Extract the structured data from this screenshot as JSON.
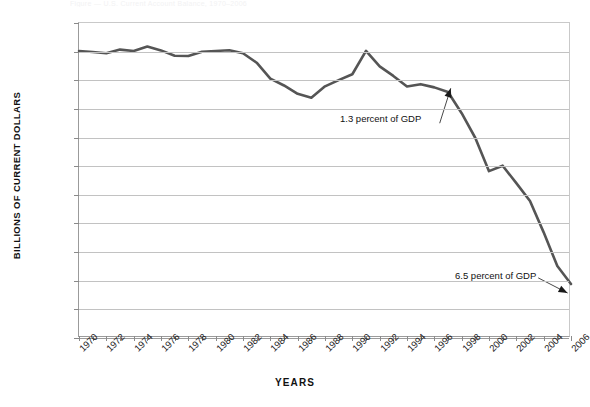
{
  "figure": {
    "title_remnant": "Figure — U.S. Current Account Balance, 1970–2006"
  },
  "axes": {
    "ylabel": "BILLIONS OF CURRENT DOLLARS",
    "xlabel": "YEARS"
  },
  "chart_data": {
    "type": "line",
    "title": "",
    "xlabel": "YEARS",
    "ylabel": "BILLIONS OF CURRENT DOLLARS",
    "ylim": [
      -1000000,
      100000
    ],
    "xlim": [
      1970,
      2006
    ],
    "grid": true,
    "legend": "none",
    "ytick_labels": [
      "100,000",
      "0",
      "–100,000",
      "–200,000",
      "–300,000",
      "–400,000",
      "–500,000",
      "–600,000",
      "–700,000",
      "–800,000",
      "–900,000",
      "–1,000,000"
    ],
    "ytick_values": [
      100000,
      0,
      -100000,
      -200000,
      -300000,
      -400000,
      -500000,
      -600000,
      -700000,
      -800000,
      -900000,
      -1000000
    ],
    "xtick_labels": [
      "1970",
      "1972",
      "1974",
      "1976",
      "1978",
      "1980",
      "1982",
      "1984",
      "1986",
      "1988",
      "1990",
      "1992",
      "1994",
      "1996",
      "1998",
      "2000",
      "2002",
      "2004",
      "2006"
    ],
    "xtick_values": [
      1970,
      1972,
      1974,
      1976,
      1978,
      1980,
      1982,
      1984,
      1986,
      1988,
      1990,
      1992,
      1994,
      1996,
      1998,
      2000,
      2002,
      2004,
      2006
    ],
    "x": [
      1970,
      1971,
      1972,
      1973,
      1974,
      1975,
      1976,
      1977,
      1978,
      1979,
      1980,
      1981,
      1982,
      1983,
      1984,
      1985,
      1986,
      1987,
      1988,
      1989,
      1990,
      1991,
      1992,
      1993,
      1994,
      1995,
      1996,
      1997,
      1998,
      1999,
      2000,
      2001,
      2002,
      2003,
      2004,
      2005,
      2006
    ],
    "values": [
      2300,
      -1400,
      -5800,
      7100,
      2000,
      18100,
      4300,
      -14300,
      -15100,
      -285,
      2300,
      5000,
      -5500,
      -38700,
      -94300,
      -118200,
      -147200,
      -160700,
      -121200,
      -99500,
      -79000,
      2900,
      -51600,
      -84800,
      -121600,
      -113600,
      -124800,
      -140700,
      -215100,
      -301600,
      -417400,
      -398300,
      -459100,
      -521500,
      -631100,
      -748700,
      -811500
    ],
    "series_color": "#555555",
    "annotations": [
      {
        "text": "1.3 percent of GDP",
        "points_to_year": 1997,
        "points_to_value": -110000
      },
      {
        "text": "6.5 percent of GDP",
        "points_to_year": 2006,
        "points_to_value": -850000
      }
    ]
  }
}
